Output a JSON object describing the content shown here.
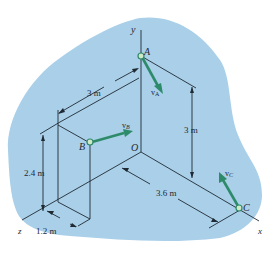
{
  "colors": {
    "background_blob": "#a9cfe9",
    "line": "#1f2a33",
    "vector": "#2e8b6a",
    "point_fill": "#cfe8c8",
    "point_stroke": "#2e8b6a"
  },
  "axes": {
    "y": "y",
    "x": "x",
    "z": "z",
    "origin": "O"
  },
  "points": {
    "A": "A",
    "B": "B",
    "C": "C"
  },
  "vectors": {
    "vA": "v",
    "vA_sub": "A",
    "vB": "v",
    "vB_sub": "B",
    "vC": "v",
    "vC_sub": "C"
  },
  "dimensions": {
    "top_width": "3 m",
    "right_height": "3 m",
    "left_height": "2.4 m",
    "x_offset": "3.6 m",
    "z_depth": "1.2 m"
  }
}
